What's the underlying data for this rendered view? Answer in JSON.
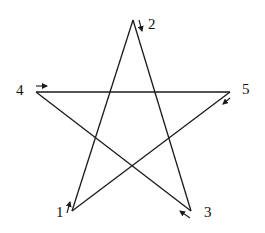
{
  "diagram": {
    "type": "pentagram",
    "vertices": [
      {
        "id": "1",
        "label": "1",
        "x": 72,
        "y": 211
      },
      {
        "id": "2",
        "label": "2",
        "x": 133,
        "y": 20
      },
      {
        "id": "3",
        "label": "3",
        "x": 191,
        "y": 211
      },
      {
        "id": "4",
        "label": "4",
        "x": 36,
        "y": 92
      },
      {
        "id": "5",
        "label": "5",
        "x": 230,
        "y": 92
      }
    ],
    "edges": [
      {
        "from": "1",
        "to": "2"
      },
      {
        "from": "2",
        "to": "3"
      },
      {
        "from": "3",
        "to": "4"
      },
      {
        "from": "4",
        "to": "5"
      },
      {
        "from": "5",
        "to": "1"
      }
    ],
    "direction_arrows": [
      {
        "at": "1",
        "direction": "up"
      },
      {
        "at": "2",
        "direction": "down"
      },
      {
        "at": "3",
        "direction": "up-left"
      },
      {
        "at": "4",
        "direction": "right"
      },
      {
        "at": "5",
        "direction": "down-left"
      }
    ]
  },
  "labels": {
    "v1": "1",
    "v2": "2",
    "v3": "3",
    "v4": "4",
    "v5": "5"
  }
}
